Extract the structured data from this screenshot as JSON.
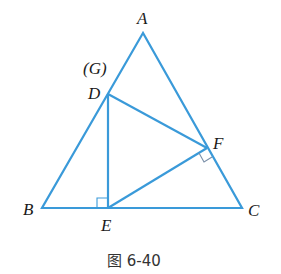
{
  "diagram": {
    "type": "geometry-triangle",
    "line_color": "#3a9ad9",
    "right_angle_color": "#3a9ad9",
    "points": {
      "A": {
        "label": "A",
        "x": 143,
        "y": 33
      },
      "B": {
        "label": "B",
        "x": 42,
        "y": 208
      },
      "C": {
        "label": "C",
        "x": 242,
        "y": 208
      },
      "D": {
        "label": "D",
        "x": 108,
        "y": 94
      },
      "E": {
        "label": "E",
        "x": 108,
        "y": 208
      },
      "F": {
        "label": "F",
        "x": 207,
        "y": 148
      }
    },
    "extra_label": "(G)",
    "segments": [
      "AB",
      "BC",
      "CA",
      "DE",
      "DF",
      "EF"
    ],
    "right_angles": [
      "at E between ED and EB",
      "at F between FE and FC"
    ],
    "caption": "图 6-40"
  }
}
